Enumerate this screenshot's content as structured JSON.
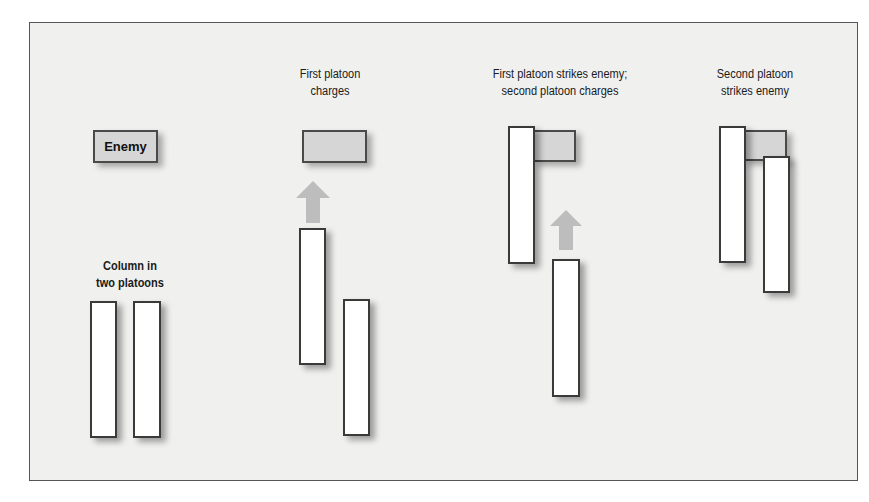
{
  "diagram": {
    "type": "military-tactics-sequence",
    "colors": {
      "background": "#f0f0ef",
      "frame_border": "#555555",
      "platoon_fill": "#ffffff",
      "enemy_fill": "#d6d6d6",
      "outline": "#3a3a3a",
      "arrow": "#bdbdbd"
    },
    "panels": [
      {
        "id": "initial",
        "enemy_label": "Enemy",
        "caption": "Column in two platoons",
        "caption_lines": [
          "Column in",
          "two platoons"
        ]
      },
      {
        "id": "first-charge",
        "caption": "First platoon charges",
        "caption_lines": [
          "First platoon",
          "charges"
        ]
      },
      {
        "id": "first-strike",
        "caption": "First platoon strikes enemy; second platoon charges",
        "caption_lines": [
          "First platoon strikes enemy;",
          "second platoon charges"
        ]
      },
      {
        "id": "second-strike",
        "caption": "Second platoon strikes enemy",
        "caption_lines": [
          "Second platoon",
          "strikes enemy"
        ]
      }
    ]
  }
}
